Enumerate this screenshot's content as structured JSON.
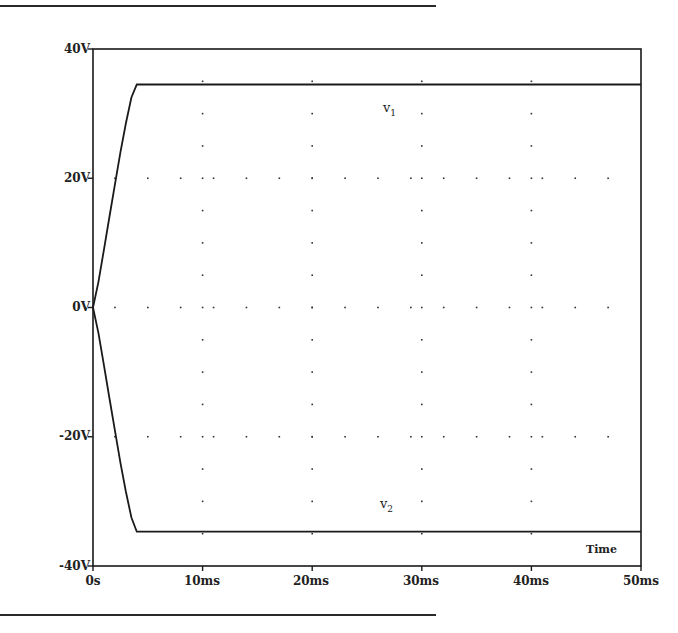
{
  "chart_data": {
    "type": "line",
    "title": "",
    "xlabel": "Time",
    "ylabel": "",
    "xlim": [
      0,
      50
    ],
    "ylim": [
      -40,
      40
    ],
    "x_unit": "ms",
    "y_unit": "V",
    "grid": "dotted",
    "legend": "inline trace labels",
    "x_ticks": [
      "0s",
      "10ms",
      "20ms",
      "30ms",
      "40ms",
      "50ms"
    ],
    "y_ticks": [
      "40V",
      "20V",
      "0V",
      "-20V",
      "-40V"
    ],
    "x": [
      0,
      0.5,
      1,
      1.5,
      2,
      2.5,
      3,
      3.5,
      4,
      5,
      10,
      20,
      30,
      40,
      50
    ],
    "series": [
      {
        "name": "v1",
        "label_main": "v",
        "label_sub": "1",
        "values": [
          0,
          4,
          9,
          14,
          19,
          24,
          28.5,
          32.5,
          34.5,
          34.5,
          34.5,
          34.5,
          34.5,
          34.5,
          34.5
        ]
      },
      {
        "name": "v2",
        "label_main": "v",
        "label_sub": "2",
        "values": [
          0,
          -4,
          -9,
          -14,
          -19,
          -24,
          -28.5,
          -32.5,
          -34.7,
          -34.7,
          -34.7,
          -34.7,
          -34.7,
          -34.7,
          -34.7
        ]
      }
    ],
    "annotations": [
      {
        "text": "v1",
        "x_ms": 27,
        "y_v": 29
      },
      {
        "text": "v2",
        "x_ms": 27,
        "y_v": -31
      },
      {
        "text": "Time",
        "x_ms": 46,
        "y_v": -36.5
      }
    ]
  },
  "axes": {
    "y_labels": [
      "40V",
      "20V",
      "0V",
      "-20V",
      "-40V"
    ],
    "x_labels": [
      "0s",
      "10ms",
      "20ms",
      "30ms",
      "40ms",
      "50ms"
    ],
    "x_title": "Time"
  },
  "traces": {
    "v1": {
      "main": "v",
      "sub": "1"
    },
    "v2": {
      "main": "v",
      "sub": "2"
    }
  },
  "colors": {
    "ink": "#1a1a1a",
    "background": "#ffffff"
  }
}
